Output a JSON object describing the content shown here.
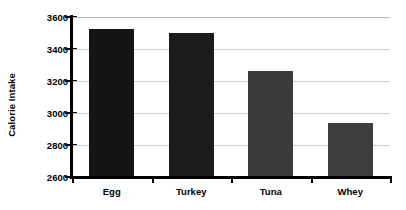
{
  "chart_data": {
    "type": "bar",
    "title": "",
    "subtitle": "",
    "xlabel": "",
    "ylabel": "Calorie Intake",
    "categories": [
      "Egg",
      "Turkey",
      "Tuna",
      "Whey"
    ],
    "values": [
      3525,
      3500,
      3265,
      2940
    ],
    "ylim": [
      2600,
      3600
    ],
    "ytick_labels": [
      "2600",
      "2800",
      "3000",
      "3200",
      "3400",
      "3600"
    ],
    "ytick_values": [
      2600,
      2800,
      3000,
      3200,
      3400,
      3600
    ],
    "ytick_step": 200,
    "grid": true,
    "grid_axis": "y",
    "legend": false,
    "legend_position": "none",
    "annotations": [],
    "bar_colors": [
      "#141414",
      "#1c1c1c",
      "#3a3a3a",
      "#3d3d3d"
    ],
    "background_color": "#ffffff",
    "gridline_color": "#cfcfcf",
    "axis_color": "#000000"
  }
}
